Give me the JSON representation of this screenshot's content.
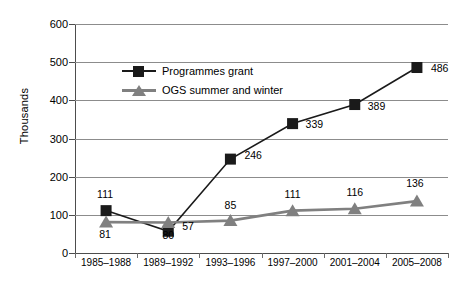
{
  "chart_data": {
    "type": "line",
    "title": "",
    "xlabel": "",
    "ylabel": "Thousands",
    "ylim": [
      0,
      600
    ],
    "ystep": 100,
    "ytick_labels": [
      "600",
      "500",
      "400",
      "300",
      "200",
      "100",
      "0"
    ],
    "grid": "horizontal",
    "legend_position": "inside-top-left",
    "categories": [
      "1985–1988",
      "1989–1992",
      "1993–1996",
      "1997–2000",
      "2001–2004",
      "2005–2008"
    ],
    "series": [
      {
        "name": "Programmes grant",
        "marker": "square",
        "color": "#1a1a1a",
        "values": [
          111,
          57,
          246,
          339,
          389,
          486
        ],
        "labels": [
          "111",
          "57",
          "246",
          "339",
          "389",
          "486"
        ]
      },
      {
        "name": "OGS summer and winter",
        "marker": "triangle",
        "color": "#808080",
        "values": [
          81,
          80,
          85,
          111,
          116,
          136
        ],
        "labels": [
          "81",
          "80",
          "85",
          "111",
          "116",
          "136"
        ]
      }
    ]
  },
  "legend": {
    "items": [
      {
        "label": "Programmes grant",
        "marker": "square-marker",
        "color": "#1a1a1a"
      },
      {
        "label": "OGS summer and winter",
        "marker": "triangle-marker",
        "color": "#808080"
      }
    ]
  },
  "colors": {
    "series_primary": "#1a1a1a",
    "series_secondary": "#808080",
    "gridline": "#8c8c8c",
    "axis": "#4d4d4d",
    "background": "#ffffff"
  }
}
